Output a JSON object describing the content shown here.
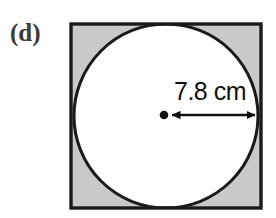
{
  "figure": {
    "part_label": "(d)",
    "dimension_label": "7.8 cm",
    "shape_outer": "square",
    "shape_inner": "circle",
    "inner_description": "circle inscribed in square",
    "measurement": {
      "value": 7.8,
      "unit": "cm",
      "measures": "radius"
    },
    "colors": {
      "shaded_region": "#c9c9c9",
      "circle_fill": "#ffffff",
      "outline": "#1a1a1a",
      "page_background": "#ffffff",
      "label_text": "#3a3a3a",
      "dimension_text": "#111111"
    },
    "geometry": {
      "square_left": 71,
      "square_top": 24,
      "square_right": 261,
      "square_bottom": 208,
      "circle_center_x": 166,
      "circle_center_y": 116,
      "circle_radius": 92,
      "arrow_start_x": 170,
      "arrow_end_x": 259,
      "arrow_y": 115,
      "center_dot_x": 164,
      "center_dot_y": 115,
      "center_dot_radius": 4
    }
  }
}
